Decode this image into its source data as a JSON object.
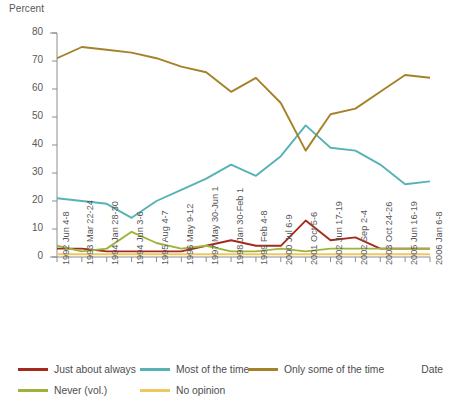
{
  "labels": {
    "y_axis_title": "Percent",
    "x_axis_title": "Date"
  },
  "chart_data": {
    "type": "line",
    "title": "",
    "xlabel": "Date",
    "ylabel": "Percent",
    "ylim": [
      0,
      80
    ],
    "yticks": [
      0,
      10,
      20,
      30,
      40,
      50,
      60,
      70,
      80
    ],
    "grid": false,
    "legend_position": "bottom",
    "categories": [
      "1992 Jun 4-8",
      "1993 Mar 22-24",
      "1994 Jan 28-30",
      "1994 Jun 3-6",
      "1995 Aug 4-7",
      "1996 May 9-12",
      "1997 May 30-Jun 1",
      "1998 Jan 30-Feb 1",
      "1999 Feb 4-8",
      "2000 Jul 6-9",
      "2001 Oct 5-6",
      "2002 Jun 17-19",
      "2002 Sep 2-4",
      "2003 Oct 24-26",
      "2005 Jun 16-19",
      "2006 Jan 6-8"
    ],
    "series": [
      {
        "name": "Just about always",
        "color": "#A52A1E",
        "values": [
          3,
          3,
          2,
          2,
          2,
          2,
          4,
          6,
          4,
          4,
          13,
          6,
          7,
          3,
          3,
          3
        ]
      },
      {
        "name": "Most of the time",
        "color": "#56B3B4",
        "values": [
          21,
          20,
          19,
          14,
          20,
          24,
          28,
          33,
          29,
          36,
          47,
          39,
          38,
          33,
          26,
          27
        ]
      },
      {
        "name": "Only some of the time",
        "color": "#A5822A",
        "values": [
          71,
          75,
          74,
          73,
          71,
          68,
          66,
          59,
          64,
          55,
          38,
          51,
          53,
          59,
          65,
          64
        ]
      },
      {
        "name": "Never (vol.)",
        "color": "#9CB43C",
        "values": [
          4,
          2,
          3,
          9,
          5,
          3,
          4,
          2,
          2,
          3,
          2,
          3,
          3,
          3,
          3,
          3
        ]
      },
      {
        "name": "No opinion",
        "color": "#EFC75E",
        "values": [
          1,
          1,
          1,
          1,
          1,
          1,
          1,
          1,
          1,
          1,
          1,
          1,
          1,
          1,
          1,
          1
        ]
      }
    ]
  }
}
